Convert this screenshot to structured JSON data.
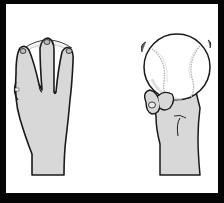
{
  "figure": {
    "panels": [
      {
        "id": "front-view",
        "description": "Back of hand with index, middle and ring fingers spread over top of baseball"
      },
      {
        "id": "side-view",
        "description": "Baseball held on top of curled fingers with thumb tucked underneath"
      }
    ],
    "colors": {
      "frame": "#050505",
      "background": "#ffffff",
      "skin": "#d8d8d8",
      "outline": "#1a1a1a",
      "ball": "#ffffff",
      "seam": "#b0b0b0"
    }
  }
}
